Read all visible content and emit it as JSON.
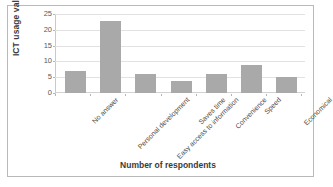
{
  "chart_data": {
    "type": "bar",
    "title": "",
    "categories": [
      "No answer",
      "Personal development",
      "Easy access to information",
      "Saves time",
      "Convenience",
      "Speed",
      "Economical"
    ],
    "values": [
      7,
      23,
      6,
      4,
      6,
      9,
      5
    ],
    "xlabel": "Number of respondents",
    "ylabel": "ICT usage value",
    "ylim": [
      0,
      25
    ],
    "ytick_step": 5,
    "yticks": [
      0,
      5,
      10,
      15,
      20,
      25
    ],
    "ytick_labels": [
      "0",
      "5",
      "10",
      "15",
      "20",
      "25"
    ],
    "grid": "horizontal",
    "legend": "none",
    "bar_color": "#a9a9a9",
    "gridline_color": "#e2e2e2",
    "frame_color": "#b9b9b9",
    "background_color": "#ffffff",
    "label_rotation_deg": -45
  }
}
